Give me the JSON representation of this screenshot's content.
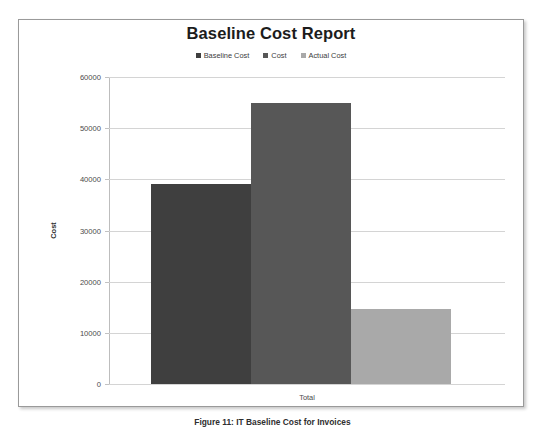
{
  "chart_data": {
    "type": "bar",
    "title": "Baseline Cost Report",
    "xlabel": "",
    "ylabel": "Cost",
    "categories": [
      "Total"
    ],
    "series": [
      {
        "name": "Baseline Cost",
        "values": [
          39000
        ],
        "color": "#3f3f3f"
      },
      {
        "name": "Cost",
        "values": [
          55000
        ],
        "color": "#575757"
      },
      {
        "name": "Actual Cost",
        "values": [
          14700
        ],
        "color": "#a9a9a9"
      }
    ],
    "ylim": [
      0,
      60000
    ],
    "y_ticks": [
      "0",
      "10000",
      "20000",
      "30000",
      "40000",
      "50000",
      "60000"
    ],
    "y_tick_values": [
      0,
      10000,
      20000,
      30000,
      40000,
      50000,
      60000
    ],
    "grid": true,
    "legend_position": "top"
  },
  "legend": {
    "items": [
      {
        "label": "Baseline Cost",
        "color": "#3f3f3f"
      },
      {
        "label": "Cost",
        "color": "#575757"
      },
      {
        "label": "Actual Cost",
        "color": "#a9a9a9"
      }
    ]
  },
  "caption": {
    "text": "Figure 11: IT Baseline Cost for Invoices"
  }
}
